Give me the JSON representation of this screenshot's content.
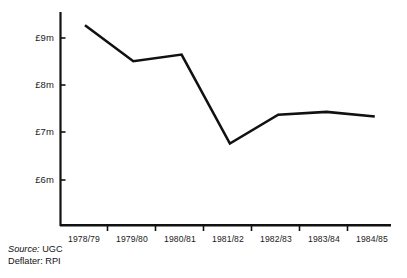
{
  "chart_data": {
    "type": "line",
    "title": "",
    "subtitle": "",
    "xlabel": "",
    "ylabel": "",
    "categories": [
      "1978/79",
      "1979/80",
      "1980/81",
      "1981/82",
      "1982/83",
      "1983/84",
      "1984/85"
    ],
    "values": [
      9.27,
      8.51,
      8.65,
      6.77,
      7.38,
      7.44,
      7.34
    ],
    "series": [
      {
        "name": "Expenditure",
        "values": [
          9.27,
          8.51,
          8.65,
          6.77,
          7.38,
          7.44,
          7.34
        ]
      }
    ],
    "ylim": [
      5.45,
      9.55
    ],
    "ytick_values": [
      9,
      8,
      7,
      6
    ],
    "ytick_labels": [
      "£9m",
      "£8m",
      "£7m",
      "£6m"
    ],
    "xtick_labels": [
      "1978/79",
      "1979/80",
      "1980/81",
      "1981/82",
      "1982/83",
      "1983/84",
      "1984/85"
    ],
    "grid": false,
    "legend": false,
    "legend_position": "none",
    "units": "£ million",
    "line_color": "#111111",
    "axis_color": "#111111",
    "background_color": "#ffffff"
  },
  "footnotes": [
    {
      "key": "Source:",
      "value": "UGC"
    },
    {
      "key": "Deflater:",
      "value": "RPI"
    }
  ]
}
